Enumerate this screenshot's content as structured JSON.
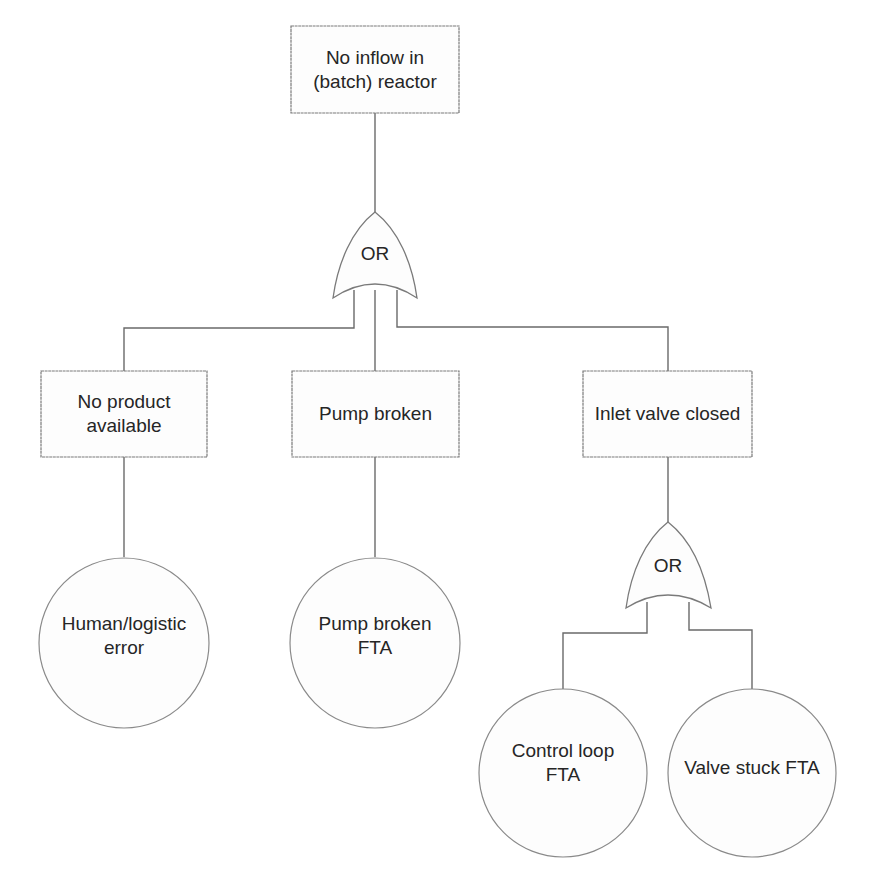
{
  "diagram": {
    "type": "fault-tree",
    "top_event": {
      "label": "No inflow in\n(batch) reactor"
    },
    "gates": [
      {
        "id": "gate-1",
        "type": "OR",
        "label": "OR"
      },
      {
        "id": "gate-2",
        "type": "OR",
        "label": "OR"
      }
    ],
    "intermediate_events": [
      {
        "id": "no-product",
        "label": "No product\navailable"
      },
      {
        "id": "pump-broken",
        "label": "Pump broken"
      },
      {
        "id": "inlet-valve",
        "label": "Inlet valve closed"
      }
    ],
    "basic_events": [
      {
        "id": "human-error",
        "label": "Human/logistic\nerror"
      },
      {
        "id": "pump-fta",
        "label": "Pump broken\nFTA"
      },
      {
        "id": "control-loop-fta",
        "label": "Control loop\nFTA"
      },
      {
        "id": "valve-stuck-fta",
        "label": "Valve stuck FTA"
      }
    ],
    "edges": [
      [
        "top_event",
        "gate-1"
      ],
      [
        "gate-1",
        "no-product"
      ],
      [
        "gate-1",
        "pump-broken"
      ],
      [
        "gate-1",
        "inlet-valve"
      ],
      [
        "no-product",
        "human-error"
      ],
      [
        "pump-broken",
        "pump-fta"
      ],
      [
        "inlet-valve",
        "gate-2"
      ],
      [
        "gate-2",
        "control-loop-fta"
      ],
      [
        "gate-2",
        "valve-stuck-fta"
      ]
    ]
  }
}
